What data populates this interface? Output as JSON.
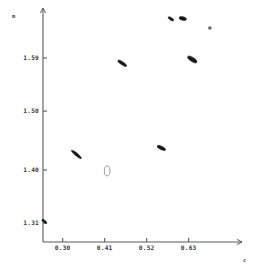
{
  "figure": {
    "header_artifact": "",
    "background_color": "#ffffff",
    "ink_color": "#1a1a1a",
    "axis_color": "#5a5a5a"
  },
  "chart_data": {
    "type": "scatter",
    "title": "",
    "subtitle": "",
    "xlabel": "c",
    "ylabel": "m",
    "xlim": [
      0.2485,
      0.7435
    ],
    "ylim": [
      1.278,
      1.668
    ],
    "xticks": [
      0.3,
      0.41,
      0.52,
      0.63
    ],
    "xticklabels": [
      "0.30",
      "0.41",
      "0.52",
      "0.63"
    ],
    "yticks": [
      1.31,
      1.4,
      1.5,
      1.59
    ],
    "yticklabels": [
      "1.31",
      "1.40",
      "1.50",
      "1.59"
    ],
    "grid": false,
    "legend": null,
    "marker_style": "tilted-ellipse",
    "series": [
      {
        "name": "data",
        "points": [
          {
            "x": 0.252,
            "y": 1.313,
            "angle": -52,
            "rx": 1.2,
            "ry": 3.0,
            "style": "filled"
          },
          {
            "x": 0.336,
            "y": 1.4265,
            "angle": -50,
            "rx": 1.4,
            "ry": 6.4,
            "style": "filled"
          },
          {
            "x": 0.456,
            "y": 1.581,
            "angle": -56,
            "rx": 1.5,
            "ry": 5.2,
            "style": "filled"
          },
          {
            "x": 0.4165,
            "y": 1.3985,
            "angle": 0,
            "rx": 2.8,
            "ry": 5.0,
            "style": "open"
          },
          {
            "x": 0.5585,
            "y": 1.4375,
            "angle": -64,
            "rx": 1.7,
            "ry": 4.6,
            "style": "filled"
          },
          {
            "x": 0.6395,
            "y": 1.5875,
            "angle": -58,
            "rx": 2.1,
            "ry": 5.4,
            "style": "filled"
          },
          {
            "x": 0.5835,
            "y": 1.6565,
            "angle": -58,
            "rx": 1.3,
            "ry": 3.2,
            "style": "filled"
          },
          {
            "x": 0.6145,
            "y": 1.657,
            "angle": -76,
            "rx": 1.8,
            "ry": 3.8,
            "style": "filled"
          },
          {
            "x": 0.6855,
            "y": 1.641,
            "angle": 0,
            "rx": 1.6,
            "ry": 1.5,
            "style": "faint"
          }
        ]
      }
    ]
  },
  "geometry": {
    "plot_left_px": 43,
    "plot_right_px": 232,
    "plot_top_px": 12,
    "plot_bottom_px": 242
  }
}
